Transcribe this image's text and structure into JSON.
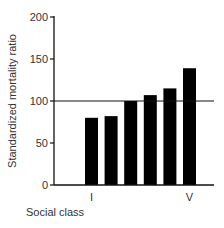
{
  "chart_data": {
    "type": "bar",
    "title": "",
    "xlabel": "Social class",
    "ylabel": "Standardized mortality ratio",
    "categories": [
      "I",
      "II",
      "IIIN",
      "IIIM",
      "IV",
      "V"
    ],
    "x_tick_labels": [
      "I",
      "",
      "",
      "",
      "",
      "V"
    ],
    "values": [
      80,
      82,
      100,
      107,
      115,
      139
    ],
    "ylim": [
      0,
      200
    ],
    "yticks": [
      0,
      50,
      100,
      150,
      200
    ],
    "reference_line": 100,
    "grid": false,
    "legend": null,
    "bar_color": "#000000"
  }
}
